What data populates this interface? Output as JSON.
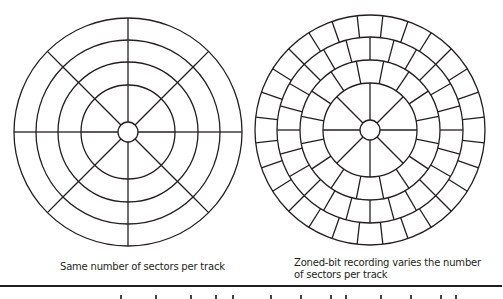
{
  "figure": {
    "line_color": "#231f20",
    "background": "#ffffff",
    "disks": [
      {
        "id": "constant-sectors",
        "cx": 128,
        "cy": 132,
        "hub_radius": 10,
        "rings": [
          {
            "r_inner": 10,
            "r_outer": 47,
            "sectors": 8,
            "offset_deg": 0
          },
          {
            "r_inner": 47,
            "r_outer": 70,
            "sectors": 8,
            "offset_deg": 0
          },
          {
            "r_inner": 70,
            "r_outer": 92,
            "sectors": 8,
            "offset_deg": 0
          },
          {
            "r_inner": 92,
            "r_outer": 114,
            "sectors": 8,
            "offset_deg": 0
          }
        ],
        "caption": "Same number of sectors per track"
      },
      {
        "id": "zoned-bit-recording",
        "cx": 370,
        "cy": 130,
        "hub_radius": 10,
        "rings": [
          {
            "r_inner": 10,
            "r_outer": 47,
            "sectors": 8,
            "offset_deg": 0
          },
          {
            "r_inner": 47,
            "r_outer": 70,
            "sectors": 16,
            "offset_deg": 11.25
          },
          {
            "r_inner": 70,
            "r_outer": 93,
            "sectors": 24,
            "offset_deg": 0
          },
          {
            "r_inner": 93,
            "r_outer": 115,
            "sectors": 28,
            "offset_deg": 6.43
          }
        ],
        "caption_line1": "Zoned-bit recording varies the number",
        "caption_line2": "of sectors per track"
      }
    ]
  },
  "captions": {
    "left": "Same number of sectors per track",
    "right_line1": "Zoned-bit recording varies the number",
    "right_line2": "of sectors per track"
  }
}
